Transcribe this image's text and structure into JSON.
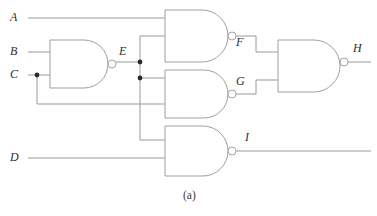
{
  "figure": {
    "caption": "(a)",
    "kind": "logic-circuit-schematic",
    "width": 377,
    "height": 216,
    "background_color": "#ffffff",
    "wire_color": "#8f8f8f",
    "gate_outline_color": "#9a9a9a",
    "label_color": "#2e2e2e",
    "junction_color": "#2b2b2b"
  },
  "inputs": [
    {
      "id": "A",
      "label": "A",
      "label_x": 14,
      "label_y": 18,
      "wire_y": 18
    },
    {
      "id": "B",
      "label": "B",
      "label_x": 14,
      "label_y": 52,
      "wire_y": 52
    },
    {
      "id": "C",
      "label": "C",
      "label_x": 14,
      "label_y": 75,
      "wire_y": 75
    },
    {
      "id": "D",
      "label": "D",
      "label_x": 14,
      "label_y": 158,
      "wire_y": 158
    }
  ],
  "internal_signals": [
    {
      "id": "E",
      "label": "E",
      "label_x": 123,
      "label_y": 52
    },
    {
      "id": "F",
      "label": "F",
      "label_x": 240,
      "label_y": 43
    },
    {
      "id": "G",
      "label": "G",
      "label_x": 240,
      "label_y": 82
    },
    {
      "id": "I",
      "label": "I",
      "label_x": 249,
      "label_y": 138
    }
  ],
  "outputs": [
    {
      "id": "H",
      "label": "H",
      "label_x": 357,
      "label_y": 49,
      "wire_y": 62
    },
    {
      "id": "I",
      "label": "I",
      "label_x": 249,
      "label_y": 138,
      "wire_y": 151
    }
  ],
  "gates": [
    {
      "id": "gate-e",
      "type": "NAND",
      "name": "nand-gate-e",
      "output_signal": "E",
      "inputs": [
        "B",
        "C"
      ],
      "x": 50,
      "y": 40,
      "w": 58,
      "h": 48,
      "bubble_cx": 112,
      "bubble_cy": 64,
      "bubble_r": 4
    },
    {
      "id": "gate-f",
      "type": "NAND",
      "name": "nand-gate-f",
      "output_signal": "F",
      "inputs": [
        "A",
        "E"
      ],
      "x": 165,
      "y": 10,
      "w": 63,
      "h": 52,
      "bubble_cx": 232,
      "bubble_cy": 36,
      "bubble_r": 4
    },
    {
      "id": "gate-g",
      "type": "NAND",
      "name": "nand-gate-g",
      "output_signal": "G",
      "inputs": [
        "E",
        "C"
      ],
      "x": 165,
      "y": 70,
      "w": 63,
      "h": 48,
      "bubble_cx": 232,
      "bubble_cy": 94,
      "bubble_r": 4
    },
    {
      "id": "gate-i",
      "type": "NAND",
      "name": "nand-gate-i",
      "output_signal": "I",
      "inputs": [
        "E",
        "D"
      ],
      "x": 165,
      "y": 126,
      "w": 63,
      "h": 50,
      "bubble_cx": 232,
      "bubble_cy": 151,
      "bubble_r": 4
    },
    {
      "id": "gate-h",
      "type": "NAND",
      "name": "nand-gate-h",
      "output_signal": "H",
      "inputs": [
        "F",
        "G"
      ],
      "x": 278,
      "y": 40,
      "w": 62,
      "h": 52,
      "bubble_cx": 344,
      "bubble_cy": 62,
      "bubble_r": 4
    }
  ],
  "junctions": [
    {
      "id": "junction-c",
      "name": "junction-dot-c",
      "cx": 37,
      "cy": 75,
      "r": 2.4
    },
    {
      "id": "junction-e-top",
      "name": "junction-dot-e-upper",
      "cx": 140,
      "cy": 62,
      "r": 2.4
    },
    {
      "id": "junction-e-bottom",
      "name": "junction-dot-e-lower",
      "cx": 140,
      "cy": 78,
      "r": 2.4
    }
  ],
  "wires": [
    {
      "id": "wire-a-in",
      "name": "wire-input-a",
      "path": "M 28 18 L 165 18"
    },
    {
      "id": "wire-b-in",
      "name": "wire-input-b",
      "path": "M 28 52 L 50 52"
    },
    {
      "id": "wire-c-in",
      "name": "wire-input-c",
      "path": "M 28 75 L 50 75"
    },
    {
      "id": "wire-c-branch",
      "name": "wire-c-branch-to-gate-g",
      "path": "M 37 75 L 37 104 L 165 104"
    },
    {
      "id": "wire-e-out",
      "name": "wire-e-output",
      "path": "M 116 62 L 140 62"
    },
    {
      "id": "wire-e-to-f",
      "name": "wire-e-to-gate-f",
      "path": "M 140 62 L 140 36 L 165 36"
    },
    {
      "id": "wire-e-down",
      "name": "wire-e-trunk-down",
      "path": "M 140 62 L 140 140"
    },
    {
      "id": "wire-e-to-g",
      "name": "wire-e-to-gate-g",
      "path": "M 140 78 L 165 78"
    },
    {
      "id": "wire-e-to-i",
      "name": "wire-e-to-gate-i",
      "path": "M 140 140 L 165 140"
    },
    {
      "id": "wire-d-in",
      "name": "wire-input-d",
      "path": "M 28 158 L 165 158"
    },
    {
      "id": "wire-f-out",
      "name": "wire-f-output",
      "path": "M 236 36 L 256 36 L 256 52 L 278 52"
    },
    {
      "id": "wire-g-out",
      "name": "wire-g-output",
      "path": "M 236 94 L 256 94 L 256 80 L 278 80"
    },
    {
      "id": "wire-h-out",
      "name": "wire-h-output",
      "path": "M 348 62 L 371 62"
    },
    {
      "id": "wire-i-out",
      "name": "wire-i-output",
      "path": "M 236 151 L 371 151"
    }
  ]
}
